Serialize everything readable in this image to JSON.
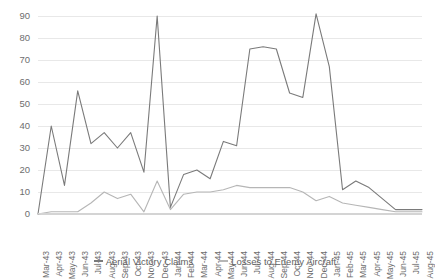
{
  "chart_data": {
    "type": "line",
    "title": "",
    "subtitle": "",
    "xlabel": "",
    "ylabel": "",
    "ylim": [
      0,
      90
    ],
    "yticks": [
      0,
      10,
      20,
      30,
      40,
      50,
      60,
      70,
      80,
      90
    ],
    "grid": true,
    "legend_position": "bottom",
    "categories": [
      "Mar-43",
      "Apr-43",
      "May-43",
      "Jun-43",
      "Jul-43",
      "Aug-43",
      "Sep-43",
      "Oct-43",
      "Nov-43",
      "Dec-43",
      "Jan-44",
      "Feb-44",
      "Mar-44",
      "Apr-44",
      "May-44",
      "Jun-44",
      "Jul-44",
      "Aug-44",
      "Sep-44",
      "Oct-44",
      "Nov-44",
      "Dec-44",
      "Jan-45",
      "Feb-45",
      "Mar-45",
      "Apr-45",
      "May-45",
      "Jun-45",
      "Jul-45",
      "Aug-45"
    ],
    "series": [
      {
        "name": "Aerial Victory Claims",
        "color": "#7a7a7a",
        "values": [
          0,
          40,
          13,
          56,
          32,
          37,
          30,
          37,
          19,
          90,
          3,
          18,
          20,
          16,
          33,
          31,
          75,
          76,
          75,
          55,
          53,
          91,
          67,
          11,
          15,
          12,
          7,
          2,
          2,
          2
        ]
      },
      {
        "name": "Losses to Enemy Aircraft",
        "color": "#b6b6b6",
        "values": [
          0,
          1,
          1,
          1,
          5,
          10,
          7,
          9,
          1,
          15,
          2,
          9,
          10,
          10,
          11,
          13,
          12,
          12,
          12,
          12,
          10,
          6,
          8,
          5,
          4,
          3,
          2,
          1,
          1,
          1
        ]
      }
    ]
  },
  "legend": {
    "items": [
      {
        "label": "Aerial Victory Claims"
      },
      {
        "label": "Losses to Enemy Aircraft"
      }
    ]
  }
}
